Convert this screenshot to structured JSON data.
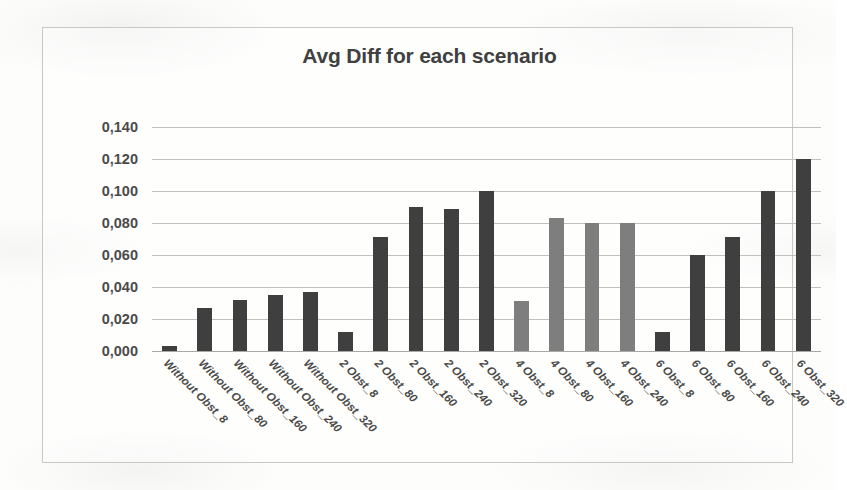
{
  "chart_data": {
    "type": "bar",
    "title": "Avg Diff for each scenario",
    "xlabel": "",
    "ylabel": "",
    "ylim": [
      0.0,
      0.14
    ],
    "ytick_labels": [
      "0,140",
      "0,120",
      "0,100",
      "0,080",
      "0,060",
      "0,040",
      "0,020",
      "0,000"
    ],
    "ytick_values": [
      0.14,
      0.12,
      0.1,
      0.08,
      0.06,
      0.04,
      0.02,
      0.0
    ],
    "grid": true,
    "legend": "none",
    "decimal_separator": ",",
    "categories": [
      "Without Obst_8",
      "Without Obst_80",
      "Without Obst_160",
      "Without Obst_240",
      "Without Obst_320",
      "2 Obst_8",
      "2 Obst_80",
      "2 Obst_160",
      "2 Obst_240",
      "2 Obst_320",
      "4 Obst_8",
      "4 Obst_80",
      "4 Obst_160",
      "4 Obst_240",
      "6 Obst_8",
      "6 Obst_80",
      "6 Obst_160",
      "6 Obst_240",
      "6 Obst_320"
    ],
    "values": [
      0.003,
      0.027,
      0.032,
      0.035,
      0.037,
      0.012,
      0.071,
      0.09,
      0.089,
      0.1,
      0.031,
      0.083,
      0.08,
      0.08,
      0.012,
      0.06,
      0.071,
      0.1,
      0.12
    ],
    "bar_colors": [
      "#3f3f3f",
      "#3f3f3f",
      "#3f3f3f",
      "#3f3f3f",
      "#3f3f3f",
      "#3f3f3f",
      "#3f3f3f",
      "#3f3f3f",
      "#3f3f3f",
      "#3f3f3f",
      "#7e7e7e",
      "#7e7e7e",
      "#7e7e7e",
      "#7e7e7e",
      "#3f3f3f",
      "#3f3f3f",
      "#3f3f3f",
      "#3f3f3f",
      "#3f3f3f"
    ],
    "colors": {
      "bar_dark": "#3f3f3f",
      "bar_light": "#7e7e7e",
      "gridline": "#c0c0bc",
      "border": "#c8c8c4",
      "text": "#4a4a4a",
      "background": "#fdfdfc"
    }
  }
}
